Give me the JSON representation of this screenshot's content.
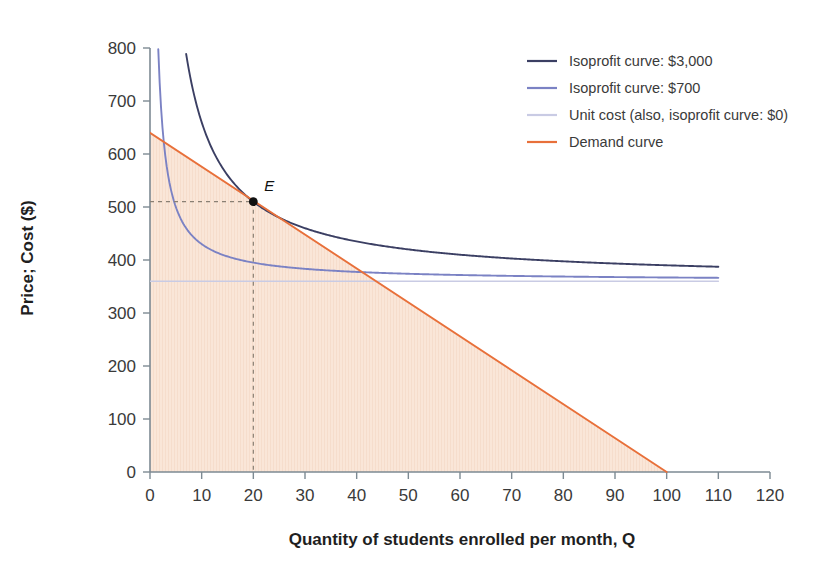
{
  "chart_data": {
    "type": "line",
    "title": "",
    "xlabel": "Quantity of students enrolled per month, Q",
    "ylabel": "Price; Cost ($)",
    "xlim": [
      0,
      120
    ],
    "ylim": [
      0,
      800
    ],
    "xticks": [
      0,
      10,
      20,
      30,
      40,
      50,
      60,
      70,
      80,
      90,
      100,
      110,
      120
    ],
    "yticks": [
      0,
      100,
      200,
      300,
      400,
      500,
      600,
      700,
      800
    ],
    "grid": false,
    "legend_position": "top-right",
    "series": [
      {
        "name": "Isoprofit curve: $3,000",
        "color": "#3b3f63",
        "type": "isoprofit",
        "profit": 3000,
        "unit_cost": 360,
        "formula": "P = 360 + 3000/Q",
        "x_start": 7.0,
        "x_end": 110,
        "points": [
          {
            "x": 7.0,
            "y": 788.6
          },
          {
            "x": 8,
            "y": 735
          },
          {
            "x": 10,
            "y": 660
          },
          {
            "x": 12,
            "y": 610
          },
          {
            "x": 15,
            "y": 560
          },
          {
            "x": 20,
            "y": 510
          },
          {
            "x": 25,
            "y": 480
          },
          {
            "x": 30,
            "y": 460
          },
          {
            "x": 40,
            "y": 435
          },
          {
            "x": 50,
            "y": 420
          },
          {
            "x": 60,
            "y": 410
          },
          {
            "x": 70,
            "y": 402.9
          },
          {
            "x": 80,
            "y": 397.5
          },
          {
            "x": 90,
            "y": 393.3
          },
          {
            "x": 100,
            "y": 390
          },
          {
            "x": 110,
            "y": 387.3
          }
        ]
      },
      {
        "name": "Isoprofit curve: $700",
        "color": "#7b82c4",
        "type": "isoprofit",
        "profit": 700,
        "unit_cost": 360,
        "formula": "P = 360 + 700/Q",
        "x_start": 1.6,
        "x_end": 110,
        "points": [
          {
            "x": 1.6,
            "y": 797.5
          },
          {
            "x": 2,
            "y": 710
          },
          {
            "x": 2.5,
            "y": 640
          },
          {
            "x": 3,
            "y": 593.3
          },
          {
            "x": 4,
            "y": 535
          },
          {
            "x": 5,
            "y": 500
          },
          {
            "x": 7,
            "y": 460
          },
          {
            "x": 10,
            "y": 430
          },
          {
            "x": 15,
            "y": 406.7
          },
          {
            "x": 20,
            "y": 395
          },
          {
            "x": 30,
            "y": 383.3
          },
          {
            "x": 40,
            "y": 377.5
          },
          {
            "x": 60,
            "y": 371.7
          },
          {
            "x": 80,
            "y": 368.8
          },
          {
            "x": 100,
            "y": 367
          },
          {
            "x": 110,
            "y": 366.4
          }
        ]
      },
      {
        "name": "Unit cost (also, isoprofit curve: $0)",
        "color": "#c9cbe4",
        "type": "horizontal",
        "value": 360,
        "x_start": 0,
        "x_end": 110
      },
      {
        "name": "Demand curve",
        "color": "#e8703a",
        "type": "linear",
        "formula": "P = 640 - 6.4Q",
        "intercept": 640,
        "slope": -6.4,
        "x_start": 0,
        "x_end": 100,
        "points": [
          {
            "x": 0,
            "y": 640
          },
          {
            "x": 20,
            "y": 512
          },
          {
            "x": 50,
            "y": 320
          },
          {
            "x": 100,
            "y": 0
          }
        ]
      }
    ],
    "shaded_region": {
      "name": "area-under-demand-curve",
      "color": "#fae6d8",
      "vertices": [
        {
          "x": 0,
          "y": 0
        },
        {
          "x": 0,
          "y": 640
        },
        {
          "x": 100,
          "y": 0
        }
      ]
    },
    "annotations": [
      {
        "label": "E",
        "name": "point-e",
        "x": 20,
        "y": 510,
        "description": "tangency of $3,000 isoprofit curve and demand curve",
        "guides": [
          "horizontal-to-y-axis",
          "vertical-to-x-axis"
        ]
      }
    ]
  },
  "legend": {
    "items": [
      {
        "label": "Isoprofit curve: $3,000",
        "color": "#3b3f63"
      },
      {
        "label": "Isoprofit curve: $700",
        "color": "#7b82c4"
      },
      {
        "label": "Unit cost (also, isoprofit curve: $0)",
        "color": "#c9cbe4"
      },
      {
        "label": "Demand curve",
        "color": "#e8703a"
      }
    ]
  },
  "axes": {
    "x_title": "Quantity of students enrolled per month, Q",
    "y_title": "Price; Cost ($)",
    "x_tick_labels": [
      "0",
      "10",
      "20",
      "30",
      "40",
      "50",
      "60",
      "70",
      "80",
      "90",
      "100",
      "110",
      "120"
    ],
    "y_tick_labels": [
      "0",
      "100",
      "200",
      "300",
      "400",
      "500",
      "600",
      "700",
      "800"
    ]
  },
  "point_e_label": "E"
}
